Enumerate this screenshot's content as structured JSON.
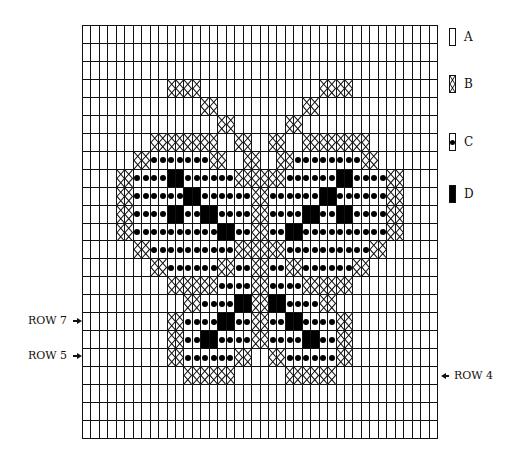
{
  "legend": {
    "items": [
      {
        "key": "A",
        "label": "A",
        "symbol": "empty-cell"
      },
      {
        "key": "B",
        "label": "B",
        "symbol": "cross-stitch-cell"
      },
      {
        "key": "C",
        "label": "C",
        "symbol": "dot-cell"
      },
      {
        "key": "D",
        "label": "D",
        "symbol": "filled-cell"
      }
    ]
  },
  "row_markers": {
    "row7": "ROW 7",
    "row5": "ROW 5",
    "row4": "ROW 4"
  },
  "grid": {
    "columns": 42,
    "rows": 23,
    "code_map": {
      ".": "A",
      "X": "B",
      "o": "C",
      "#": "D"
    },
    "pattern": [
      "..........................................",
      "..........................................",
      "..........................................",
      "..........XXXX..............XXXX..........",
      "..............XX..........XX..............",
      "................XX......XX................",
      "........XXXXXXXX..XX..XX..XXXXXXXX........",
      "......XXoooooooXX..XX..XXooooooooXX......",
      "....XXoooo##ooooooXXXXXXoooooo##ooooXX....",
      "....XXoooooo##ooooooXXoooooo##ooooooXX....",
      "....XXoooo##oo##ooooXXoooo##oo##ooooXX....",
      "....XXoooooooooo##ooXXoo##ooooooooooXX....",
      "......XXooooooooooXXXXXXooooooooooXX......",
      "........XXooooooXXooXXooXXooooooXX........",
      "..........XXXXXXooooXXooooXXXXXX..........",
      "............XXoooo##XX##ooooXX............",
      "..........XXoooo##ooXXoo##ooooXX..........",
      "..........XXoo##ooooXXoooo##ooXX..........",
      "..........XXooooooXX..XXooooooXX..........",
      "............XXXXXX......XXXXXX............",
      "..........................................",
      "..........................................",
      ".........................................."
    ]
  }
}
